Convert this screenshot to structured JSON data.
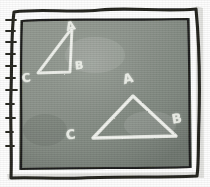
{
  "scene": {
    "title": "Similar triangles chalkboard sketch",
    "medium": "chalk-on-blackboard",
    "board_color": "#8a9189",
    "board_color_dark": "#6f776f",
    "frame_color": "#1a1a18",
    "chalk_color": "#eef0ea",
    "paper_color": "#fdfdfd",
    "margin_strip_color": "#d8d8d4"
  },
  "frame": {
    "outer_border_name": "sketch-outer-border",
    "inner_border_name": "sketch-inner-border",
    "ruler_edge": {
      "name": "ruler-tick-edge",
      "side": "left",
      "tick_count": 11
    }
  },
  "figures": [
    {
      "id": "small-triangle",
      "name": "small-triangle",
      "label": "Small triangle",
      "vertices": [
        {
          "label": "A",
          "x": 72,
          "y": 28
        },
        {
          "label": "B",
          "x": 70,
          "y": 72
        },
        {
          "label": "C",
          "x": 38,
          "y": 73
        }
      ]
    },
    {
      "id": "large-triangle",
      "name": "large-triangle",
      "label": "Large triangle",
      "vertices": [
        {
          "label": "A",
          "x": 133,
          "y": 96
        },
        {
          "label": "B",
          "x": 176,
          "y": 136
        },
        {
          "label": "C",
          "x": 93,
          "y": 138
        }
      ]
    }
  ],
  "labels": {
    "small": {
      "a": "A",
      "b": "B",
      "c": "C"
    },
    "large": {
      "a": "A",
      "b": "B",
      "c": "C"
    }
  }
}
